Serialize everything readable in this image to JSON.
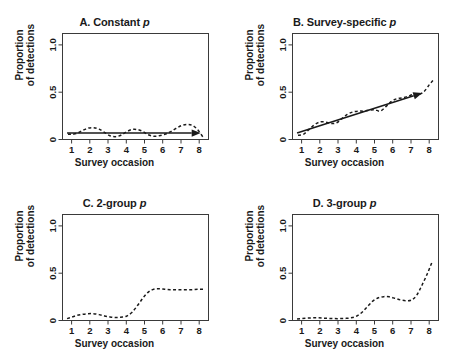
{
  "figure": {
    "layout": "2x2 panel grid",
    "width": 459,
    "height": 361,
    "background": "#ffffff",
    "ink_color": "#1a1a1a"
  },
  "axis": {
    "xlabel": "Survey occasion",
    "ylabel_line1": "Proportion",
    "ylabel_line2": "of detections",
    "xticks": [
      "1",
      "2",
      "3",
      "4",
      "5",
      "6",
      "7",
      "8"
    ],
    "yticks": [
      "0",
      "0.5",
      "1.0"
    ]
  },
  "panels": {
    "a": {
      "label": "A. Constant ",
      "italic": "p"
    },
    "b": {
      "label": "B. Survey-specific ",
      "italic": "p"
    },
    "c": {
      "label": "C. 2-group ",
      "italic": "p"
    },
    "d": {
      "label": "D. 3-group ",
      "italic": "p"
    }
  },
  "chart_data": [
    {
      "type": "line",
      "panel": "A",
      "title": "A. Constant p",
      "xlabel": "Survey occasion",
      "ylabel": "Proportion of detections",
      "xlim": [
        0.5,
        8.5
      ],
      "ylim": [
        0.0,
        1.12
      ],
      "xticks": [
        1,
        2,
        3,
        4,
        5,
        6,
        7,
        8
      ],
      "yticks": [
        0,
        0.5,
        1.0
      ],
      "grid": false,
      "legend": "none",
      "series": [
        {
          "name": "observed proportion (dashed)",
          "style": "dashed",
          "x": [
            0.8,
            1.0,
            1.3,
            1.6,
            1.9,
            2.2,
            2.5,
            2.8,
            3.1,
            3.4,
            3.7,
            4.0,
            4.3,
            4.6,
            4.9,
            5.2,
            5.5,
            5.8,
            6.1,
            6.4,
            6.7,
            7.0,
            7.3,
            7.6,
            7.9,
            8.2
          ],
          "y": [
            0.055,
            0.055,
            0.065,
            0.095,
            0.12,
            0.125,
            0.11,
            0.075,
            0.04,
            0.03,
            0.045,
            0.08,
            0.105,
            0.105,
            0.085,
            0.05,
            0.035,
            0.04,
            0.055,
            0.08,
            0.115,
            0.145,
            0.16,
            0.15,
            0.105,
            0.025
          ]
        },
        {
          "name": "fitted constant p (solid arrow)",
          "style": "solid-arrow",
          "x": [
            0.75,
            7.85
          ],
          "y": [
            0.068,
            0.068
          ]
        }
      ]
    },
    {
      "type": "line",
      "panel": "B",
      "title": "B. Survey-specific p",
      "xlabel": "Survey occasion",
      "ylabel": "Proportion of detections",
      "xlim": [
        0.5,
        8.5
      ],
      "ylim": [
        0.0,
        1.12
      ],
      "xticks": [
        1,
        2,
        3,
        4,
        5,
        6,
        7,
        8
      ],
      "yticks": [
        0,
        0.5,
        1.0
      ],
      "grid": false,
      "legend": "none",
      "series": [
        {
          "name": "observed proportion (dashed)",
          "style": "dashed",
          "x": [
            0.8,
            1.1,
            1.4,
            1.7,
            2.0,
            2.3,
            2.6,
            2.9,
            3.2,
            3.5,
            3.8,
            4.1,
            4.4,
            4.7,
            5.0,
            5.3,
            5.6,
            5.9,
            6.2,
            6.5,
            6.8,
            7.1,
            7.4,
            7.7,
            8.0,
            8.2
          ],
          "y": [
            0.045,
            0.055,
            0.105,
            0.155,
            0.185,
            0.185,
            0.17,
            0.175,
            0.22,
            0.265,
            0.29,
            0.3,
            0.3,
            0.31,
            0.315,
            0.3,
            0.345,
            0.4,
            0.43,
            0.44,
            0.455,
            0.475,
            0.475,
            0.505,
            0.58,
            0.625
          ]
        },
        {
          "name": "fitted trend (solid arrow)",
          "style": "solid-arrow",
          "x": [
            0.75,
            7.4
          ],
          "y": [
            0.068,
            0.478
          ]
        }
      ]
    },
    {
      "type": "line",
      "panel": "C",
      "title": "C. 2-group p",
      "xlabel": "Survey occasion",
      "ylabel": "Proportion of detections",
      "xlim": [
        0.5,
        8.5
      ],
      "ylim": [
        0.0,
        1.12
      ],
      "xticks": [
        1,
        2,
        3,
        4,
        5,
        6,
        7,
        8
      ],
      "yticks": [
        0,
        0.5,
        1.0
      ],
      "grid": false,
      "legend": "none",
      "series": [
        {
          "name": "observed proportion (dashed)",
          "style": "dashed",
          "x": [
            0.75,
            1.0,
            1.3,
            1.6,
            1.9,
            2.2,
            2.5,
            2.8,
            3.1,
            3.4,
            3.7,
            4.0,
            4.3,
            4.6,
            4.9,
            5.2,
            5.5,
            5.8,
            6.1,
            6.4,
            6.7,
            7.0,
            7.3,
            7.6,
            7.9,
            8.2
          ],
          "y": [
            0.02,
            0.035,
            0.055,
            0.065,
            0.072,
            0.072,
            0.062,
            0.048,
            0.038,
            0.032,
            0.035,
            0.045,
            0.085,
            0.155,
            0.235,
            0.3,
            0.33,
            0.335,
            0.33,
            0.325,
            0.325,
            0.325,
            0.325,
            0.325,
            0.33,
            0.33
          ]
        }
      ]
    },
    {
      "type": "line",
      "panel": "D",
      "title": "D. 3-group p",
      "xlabel": "Survey occasion",
      "ylabel": "Proportion of detections",
      "xlim": [
        0.5,
        8.5
      ],
      "ylim": [
        0.0,
        1.12
      ],
      "xticks": [
        1,
        2,
        3,
        4,
        5,
        6,
        7,
        8
      ],
      "yticks": [
        0,
        0.5,
        1.0
      ],
      "grid": false,
      "legend": "none",
      "series": [
        {
          "name": "observed proportion (dashed)",
          "style": "dashed",
          "x": [
            0.75,
            1.0,
            1.3,
            1.6,
            1.9,
            2.2,
            2.5,
            2.8,
            3.1,
            3.4,
            3.7,
            4.0,
            4.3,
            4.6,
            4.9,
            5.2,
            5.5,
            5.8,
            6.1,
            6.4,
            6.7,
            7.0,
            7.3,
            7.6,
            7.9,
            8.15
          ],
          "y": [
            0.015,
            0.02,
            0.025,
            0.028,
            0.028,
            0.025,
            0.022,
            0.02,
            0.02,
            0.022,
            0.028,
            0.045,
            0.085,
            0.145,
            0.205,
            0.24,
            0.252,
            0.25,
            0.235,
            0.218,
            0.21,
            0.215,
            0.265,
            0.375,
            0.5,
            0.62
          ]
        }
      ]
    }
  ]
}
